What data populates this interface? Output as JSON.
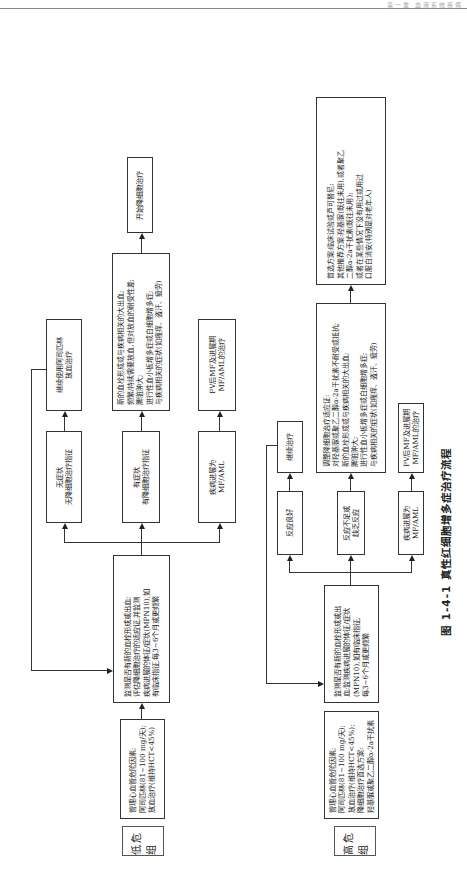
{
  "header": {
    "running_head": "第一章  血液系统疾病"
  },
  "caption": "图 1-4-1  真性红细胞增多症治疗流程",
  "low_risk": {
    "group_label": "低危组",
    "management": [
      "管理心血管危险因素;",
      "阿司匹林(81~100 mg/天);",
      "放血治疗(维持HCT<45%)"
    ],
    "monitor": [
      "监测是否有新的血栓形成或出血;",
      "评估降细胞治疗的适应证,并监测",
      "疾病进展的体征/症状(MPN10),如",
      "有临床指征,每3~6个月或更频繁"
    ],
    "branch1": [
      "无症状",
      "无降细胞治疗指征"
    ],
    "branch1_next": [
      "继续使用阿司匹林",
      "放血治疗"
    ],
    "branch2": [
      "有症状",
      "有降细胞治疗指征"
    ],
    "branch2_next": [
      "新的血栓形成或与疾病相关的大出血;",
      "频繁/持续需要放血,但对放血的耐受性差;",
      "脾脏肿大;",
      "进行性血小板增多症或白细胞增多症;",
      "与疾病相关的症状(如瘙痒、盗汗、疲劳)"
    ],
    "branch2_final": "开始降细胞治疗",
    "branch3": [
      "疾病进展为",
      "MF/AML"
    ],
    "branch3_next": [
      "PV后MF及进展期",
      "MF/AML的治疗"
    ]
  },
  "high_risk": {
    "group_label": "高危组",
    "management": [
      "管理心血管危险因素;",
      "阿司匹林(81~100 mg/天);",
      "放血治疗(维持HCT<45%);",
      "降细胞治疗首选方案:",
      "羟基脲或聚乙二醇α-2a干扰素"
    ],
    "monitor": [
      "监测是否有新的血栓形成或出",
      "血;监测疾病进展的体征/症状",
      "(MPN10),如有临床指征,",
      "每3~6个月或更频繁"
    ],
    "branch1": "反应良好",
    "branch1_next": "继续治疗",
    "branch2": [
      "反应不足或",
      "缺乏反应"
    ],
    "branch2_next": [
      "调整降细胞治疗适应证:",
      "对羟基脲或聚乙二醇α-2a干扰素不耐受或抵抗;",
      "新的血栓形成或与疾病相关的大出血;",
      "脾脏肿大;",
      "进行性血小板增多症或白细胞增多症;",
      "与疾病相关的症状(如瘙痒、盗汗、疲劳)"
    ],
    "branch2_final": [
      "首选方案:临床试验或芦可替尼;",
      "其他推荐方案:羟基脲(既往未用),或者聚乙",
      "二醇α-2a干扰素(既往未用);",
      "或者在某些情况下没有用过或用过",
      "口服白消安(特别是对老年人)"
    ],
    "branch3": [
      "疾病进展为",
      "MF/AML"
    ],
    "branch3_next": [
      "PV后MF及进展期",
      "MF/AML的治疗"
    ]
  }
}
